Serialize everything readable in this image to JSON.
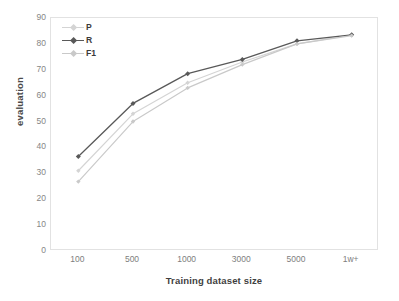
{
  "chart_data": {
    "type": "line",
    "title": "",
    "xlabel": "Training dataset size",
    "ylabel": "evaluation",
    "categories": [
      "100",
      "500",
      "1000",
      "3000",
      "5000",
      "1w+"
    ],
    "x_tick_labels": [
      "100",
      "500",
      "1000",
      "3000",
      "5000",
      "1w+"
    ],
    "y_tick_labels": [
      "90",
      "80",
      "70",
      "60",
      "50",
      "40",
      "30",
      "20",
      "10",
      "0"
    ],
    "ylim": [
      0,
      90
    ],
    "y_step": 10,
    "grid": false,
    "legend_position": "top-left",
    "series": [
      {
        "name": "P",
        "color": "#d4d4d4",
        "marker": "diamond",
        "values": [
          31.0,
          53.0,
          65.0,
          73.0,
          80.0,
          83.5
        ]
      },
      {
        "name": "R",
        "color": "#595959",
        "marker": "diamond",
        "values": [
          36.5,
          57.0,
          68.5,
          74.0,
          81.2,
          83.5
        ]
      },
      {
        "name": "F1",
        "color": "#c9c9c9",
        "marker": "diamond",
        "values": [
          26.8,
          50.0,
          63.0,
          72.0,
          80.0,
          83.2
        ]
      }
    ]
  },
  "legend": {
    "entries": [
      {
        "label": "P"
      },
      {
        "label": "R"
      },
      {
        "label": "F1"
      }
    ]
  },
  "colors": {
    "series_p": "#d4d4d4",
    "series_r": "#595959",
    "series_f1": "#c9c9c9",
    "frame": "#e2e2e2",
    "tick_text": "#868686",
    "axis_title": "#3f3f3f",
    "background": "#ffffff"
  }
}
